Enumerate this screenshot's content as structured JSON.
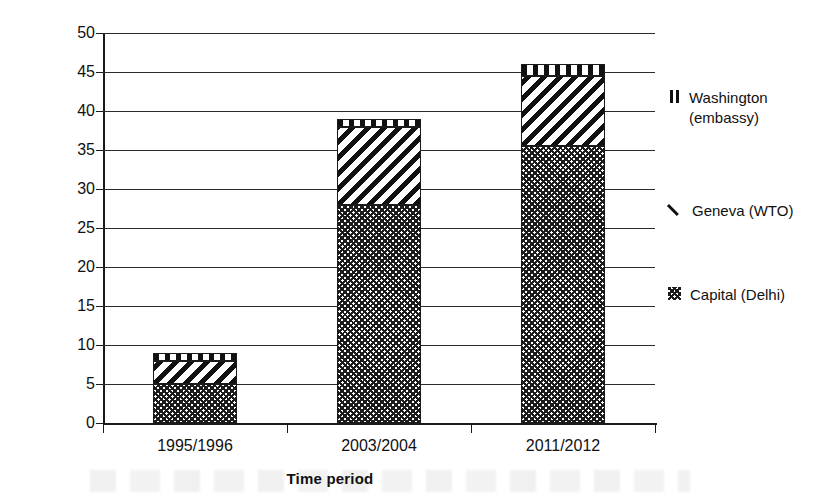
{
  "chart_data": {
    "type": "bar",
    "subtype": "stacked-bar",
    "title": "",
    "xlabel": "Time period",
    "ylabel": "Number of Staff",
    "categories": [
      "1995/1996",
      "2003/2004",
      "2011/2012"
    ],
    "ylim": [
      0,
      50
    ],
    "ytick_step": 5,
    "yticks": [
      0,
      5,
      10,
      15,
      20,
      25,
      30,
      35,
      40,
      45,
      50
    ],
    "ytick_labels": [
      "0",
      "5",
      "10",
      "15",
      "20",
      "25",
      "30",
      "35",
      "40",
      "45",
      "50"
    ],
    "grid": true,
    "grid_axis": "y",
    "legend_position": "right",
    "stack_order_bottom_to_top": [
      "Capital (Delhi)",
      "Geneva (WTO)",
      "Washington (embassy)"
    ],
    "series": [
      {
        "name": "Capital (Delhi)",
        "pattern": "crosshatch",
        "color": "#1c1c1c",
        "values": [
          5,
          28,
          35.5
        ]
      },
      {
        "name": "Geneva (WTO)",
        "pattern": "diagonal-stripes",
        "color": "#111111",
        "values": [
          3,
          10,
          9
        ]
      },
      {
        "name": "Washington (embassy)",
        "pattern": "vertical-stripes",
        "color": "#111111",
        "values": [
          1,
          1,
          1.5
        ]
      }
    ],
    "stack_totals": [
      9,
      39,
      46
    ],
    "cumulative_tops": {
      "capital": [
        5,
        28,
        35.5
      ],
      "geneva": [
        8,
        38,
        44.5
      ],
      "washington": [
        9,
        39,
        46
      ]
    }
  },
  "legend": {
    "entries": [
      {
        "label": "Washington\n(embassy)",
        "swatch": "vertical-stripes",
        "series": "Washington (embassy)"
      },
      {
        "label": "Geneva (WTO)",
        "swatch": "diagonal-stripe",
        "series": "Geneva (WTO)"
      },
      {
        "label": "Capital (Delhi)",
        "swatch": "crosshatch",
        "series": "Capital (Delhi)"
      }
    ]
  }
}
